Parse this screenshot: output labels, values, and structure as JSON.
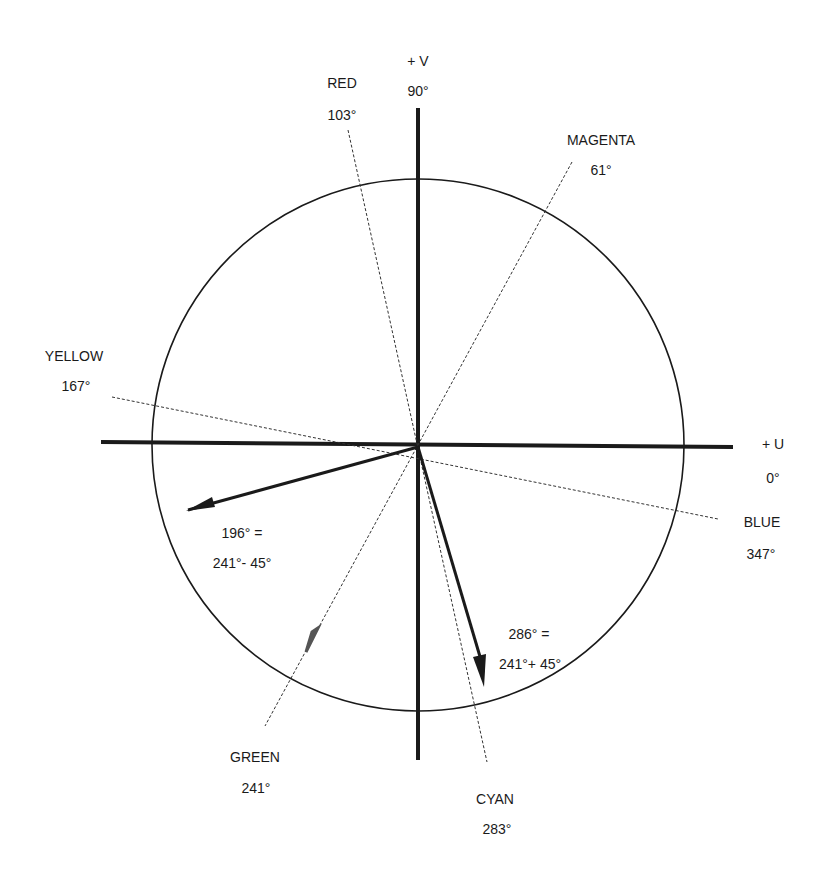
{
  "axes": {
    "v": {
      "label": "+ V",
      "angle": "90°"
    },
    "u": {
      "label": "+ U",
      "angle": "0°"
    }
  },
  "colors": [
    {
      "name": "RED",
      "angle": "103°"
    },
    {
      "name": "MAGENTA",
      "angle": "61°"
    },
    {
      "name": "YELLOW",
      "angle": "167°"
    },
    {
      "name": "BLUE",
      "angle": "347°"
    },
    {
      "name": "GREEN",
      "angle": "241°"
    },
    {
      "name": "CYAN",
      "angle": "283°"
    }
  ],
  "vectors": [
    {
      "line1": "196°  =",
      "line2": "241°- 45°"
    },
    {
      "line1": "286°  =",
      "line2": "241°+ 45°"
    }
  ],
  "style": {
    "ink": "#1a1a1a",
    "background": "#ffffff"
  }
}
